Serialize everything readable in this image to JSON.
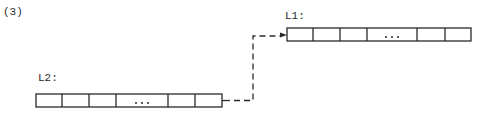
{
  "figure": {
    "number_label": "(3)"
  },
  "arrays": [
    {
      "id": "L2",
      "label": "L2:",
      "cells": [
        "",
        "",
        "",
        "...",
        "",
        ""
      ]
    },
    {
      "id": "L1",
      "label": "L1:",
      "cells": [
        "",
        "",
        "",
        "...",
        "",
        ""
      ]
    }
  ],
  "connector": {
    "from": "L2",
    "to": "L1",
    "style": "dashed",
    "arrowhead": "end"
  },
  "colors": {
    "stroke": "#2a2a2a",
    "background": "#ffffff"
  }
}
